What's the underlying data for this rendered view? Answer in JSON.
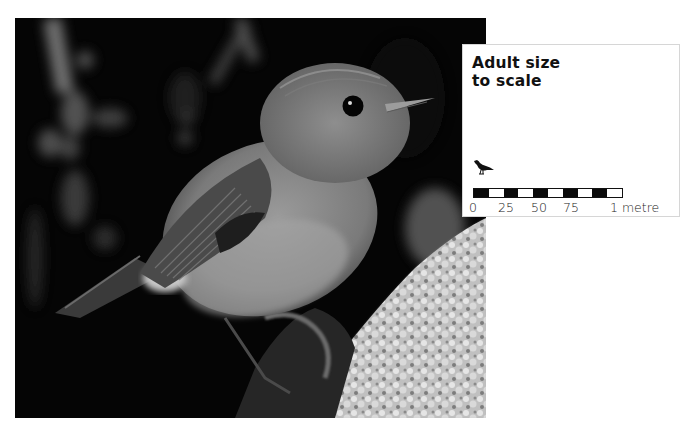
{
  "photo": {
    "subject": "small songbird perched on mossy branch",
    "palette": {
      "background": "#050505",
      "bird": "#8a8a8a",
      "moss": "#c8c8c8"
    }
  },
  "info_box": {
    "title_line1": "Adult size",
    "title_line2": "to scale",
    "icon": "bird-silhouette-icon",
    "scale_bar": {
      "segments": [
        "dark",
        "light",
        "dark",
        "light",
        "dark",
        "light",
        "dark",
        "light",
        "dark",
        "light"
      ]
    },
    "scale_labels": [
      {
        "text": "0",
        "left": 0
      },
      {
        "text": "25",
        "left": 29
      },
      {
        "text": "50",
        "left": 62
      },
      {
        "text": "75",
        "left": 94
      },
      {
        "text": "1 metre",
        "left": 141
      }
    ]
  }
}
